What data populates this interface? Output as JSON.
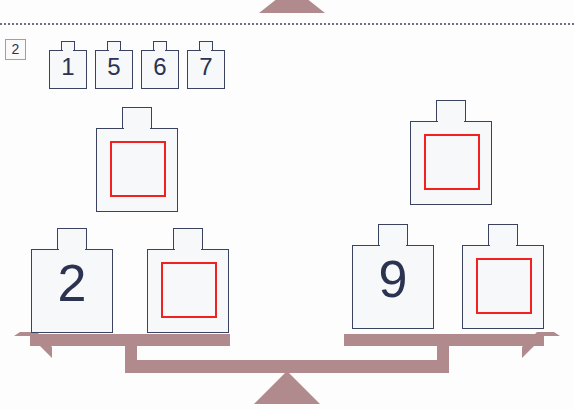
{
  "page": {
    "exercise_number": "2",
    "colors": {
      "tile_outline": "#3b4260",
      "tile_fill": "#f7f8fa",
      "blank_box": "#f32020",
      "scale": "#b08a8c",
      "digit": "#2b3350",
      "dotted_rule": "#5a5a68"
    }
  },
  "choice_tiles": [
    {
      "label": "1"
    },
    {
      "label": "5"
    },
    {
      "label": "6"
    },
    {
      "label": "7"
    }
  ],
  "left_pyramid": {
    "top": {
      "label": "",
      "blank": true
    },
    "bottom_left": {
      "label": "2",
      "blank": false
    },
    "bottom_right": {
      "label": "",
      "blank": true
    }
  },
  "right_pyramid": {
    "top": {
      "label": "",
      "blank": true
    },
    "bottom_left": {
      "label": "9",
      "blank": false
    },
    "bottom_right": {
      "label": "",
      "blank": true
    }
  },
  "icons": {
    "top_fulcrum": "triangle-fulcrum-icon",
    "bottom_fulcrum": "triangle-fulcrum-icon",
    "balance_beam": "balance-beam-icon",
    "dotted_rule": "dotted-separator-icon"
  }
}
